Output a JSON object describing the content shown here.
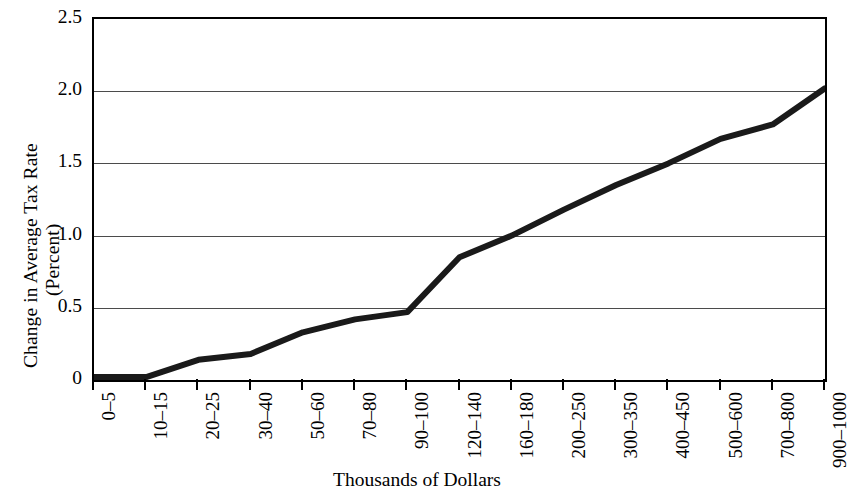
{
  "chart_data": {
    "type": "line",
    "title": "",
    "xlabel": "Thousands of Dollars",
    "ylabel": "Change in Average Tax Rate (Percent)",
    "ylabel_lines": [
      "Change in Average Tax Rate",
      "(Percent)"
    ],
    "categories": [
      "0–5",
      "10–15",
      "20–25",
      "30–40",
      "50–60",
      "70–80",
      "90–100",
      "120–140",
      "160–180",
      "200–250",
      "300–350",
      "400–450",
      "500–600",
      "700–800",
      "900–1000"
    ],
    "values": [
      0.02,
      0.02,
      0.14,
      0.18,
      0.33,
      0.42,
      0.47,
      0.85,
      1.0,
      1.18,
      1.35,
      1.5,
      1.67,
      1.77,
      2.02
    ],
    "ylim": [
      0,
      2.5
    ],
    "ytick_labels": [
      "2.5",
      "2.0",
      "1.5",
      "1.0",
      "0.5",
      "0"
    ],
    "ytick_values": [
      2.5,
      2.0,
      1.5,
      1.0,
      0.5,
      0
    ],
    "grid": true,
    "grid_axis": "y",
    "legend": "none",
    "line_color": "#1a1a1a",
    "line_width": 6,
    "axis_color": "#000000",
    "grid_color": "#4b4b4b",
    "background": "#ffffff"
  }
}
